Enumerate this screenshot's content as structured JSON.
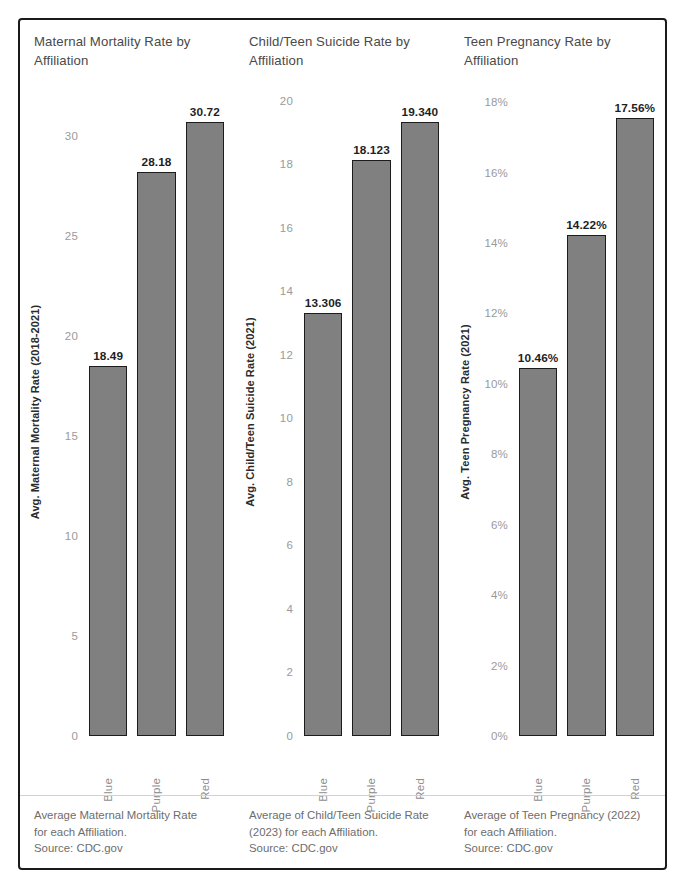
{
  "dashboard": {
    "title": "Health Outcome Rates by Political Affiliation",
    "panel_count": 3
  },
  "chart_data": [
    {
      "type": "bar",
      "title": "Maternal Mortality Rate by Affiliation",
      "categories": [
        "Blue",
        "Purple",
        "Red"
      ],
      "values": [
        18.49,
        28.18,
        30.72
      ],
      "value_labels": [
        "18.49",
        "28.18",
        "30.72"
      ],
      "xlabel": "",
      "ylabel": "Avg. Maternal Mortality Rate (2018-2021)",
      "ylim": [
        0,
        32.4
      ],
      "yticks": [
        0,
        5,
        10,
        15,
        20,
        25,
        30
      ],
      "ytick_labels": [
        "0",
        "5",
        "10",
        "15",
        "20",
        "25",
        "30"
      ],
      "grid": false,
      "legend": "none",
      "bar_color": "#808080",
      "bar_edge_color": "#1c1c1c",
      "note_lines": [
        "Average Maternal Mortality Rate",
        "for each Affiliation.",
        "Source: CDC.gov"
      ]
    },
    {
      "type": "bar",
      "title": "Child/Teen Suicide Rate by Affiliation",
      "categories": [
        "Blue",
        "Purple",
        "Red"
      ],
      "values": [
        13.306,
        18.123,
        19.34
      ],
      "value_labels": [
        "13.306",
        "18.123",
        "19.340"
      ],
      "xlabel": "",
      "ylabel": "Avg. Child/Teen Suicide Rate (2021)",
      "ylim": [
        0,
        20.4
      ],
      "yticks": [
        0,
        2,
        4,
        6,
        8,
        10,
        12,
        14,
        16,
        18,
        20
      ],
      "ytick_labels": [
        "0",
        "2",
        "4",
        "6",
        "8",
        "10",
        "12",
        "14",
        "16",
        "18",
        "20"
      ],
      "grid": false,
      "legend": "none",
      "bar_color": "#808080",
      "bar_edge_color": "#1c1c1c",
      "note_lines": [
        "Average of Child/Teen Suicide Rate",
        "(2023) for each Affiliation.",
        "Source: CDC.gov"
      ]
    },
    {
      "type": "bar",
      "title": "Teen Pregnancy Rate by Affiliation",
      "categories": [
        "Blue",
        "Purple",
        "Red"
      ],
      "values": [
        10.46,
        14.22,
        17.56
      ],
      "value_labels": [
        "10.46%",
        "14.22%",
        "17.56%"
      ],
      "xlabel": "",
      "ylabel": "Avg. Teen Pregnancy Rate (2021)",
      "ylim": [
        0,
        18.4
      ],
      "yticks": [
        0,
        2,
        4,
        6,
        8,
        10,
        12,
        14,
        16,
        18
      ],
      "ytick_labels": [
        "0%",
        "2%",
        "4%",
        "6%",
        "8%",
        "10%",
        "12%",
        "14%",
        "16%",
        "18%"
      ],
      "grid": false,
      "legend": "none",
      "bar_color": "#808080",
      "bar_edge_color": "#1c1c1c",
      "note_lines": [
        "Average of Teen Pregnancy (2022)",
        "for each Affiliation.",
        "Source: CDC.gov"
      ]
    }
  ]
}
